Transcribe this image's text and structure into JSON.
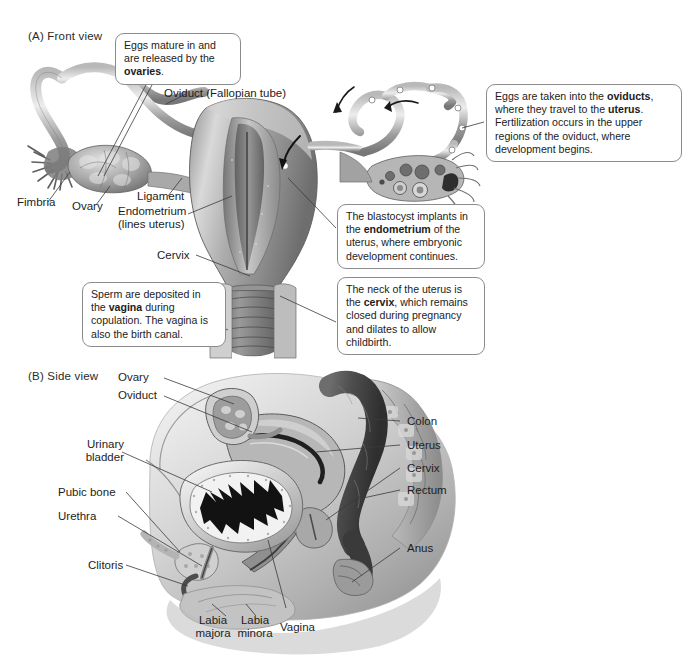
{
  "figure": {
    "background_color": "#ffffff",
    "line_color": "#3a3a3a",
    "callout_border_color": "#8c8c8c"
  },
  "panel_a": {
    "title": "(A)  Front view",
    "labels": {
      "oviduct": "Oviduct (Fallopian tube)",
      "fimbria": "Fimbria",
      "ovary": "Ovary",
      "ligament": "Ligament",
      "endometrium_line1": "Endometrium",
      "endometrium_line2": "(lines uterus)",
      "cervix": "Cervix"
    },
    "callouts": {
      "ovaries": {
        "text_before": "Eggs mature in and are released by the ",
        "bold": "ovaries",
        "text_after": "."
      },
      "oviducts": {
        "seg1": "Eggs are taken into the ",
        "bold1": "oviducts",
        "seg2": ", where they travel to the ",
        "bold2": "uterus",
        "seg3": ". Fertilization occurs in the upper regions of the oviduct, where development begins."
      },
      "endometrium": {
        "seg1": "The blastocyst implants in the ",
        "bold1": "endometrium",
        "seg2": " of the uterus, where embryonic development continues."
      },
      "cervix": {
        "seg1": "The neck of the uterus is the ",
        "bold1": "cervix",
        "seg2": ", which remains closed during pregnancy and dilates to allow childbirth."
      },
      "vagina": {
        "seg1": "Sperm are deposited in the ",
        "bold1": "vagina",
        "seg2": " during copulation. The vagina is also the birth canal."
      }
    }
  },
  "panel_b": {
    "title": "(B)  Side view",
    "labels": {
      "ovary": "Ovary",
      "oviduct": "Oviduct",
      "urinary_bladder_line1": "Urinary",
      "urinary_bladder_line2": "bladder",
      "pubic_bone": "Pubic bone",
      "urethra": "Urethra",
      "clitoris": "Clitoris",
      "colon": "Colon",
      "uterus": "Uterus",
      "cervix": "Cervix",
      "rectum": "Rectum",
      "anus": "Anus",
      "labia_majora_line1": "Labia",
      "labia_majora_line2": "majora",
      "labia_minora_line1": "Labia",
      "labia_minora_line2": "minora",
      "vagina": "Vagina"
    }
  }
}
